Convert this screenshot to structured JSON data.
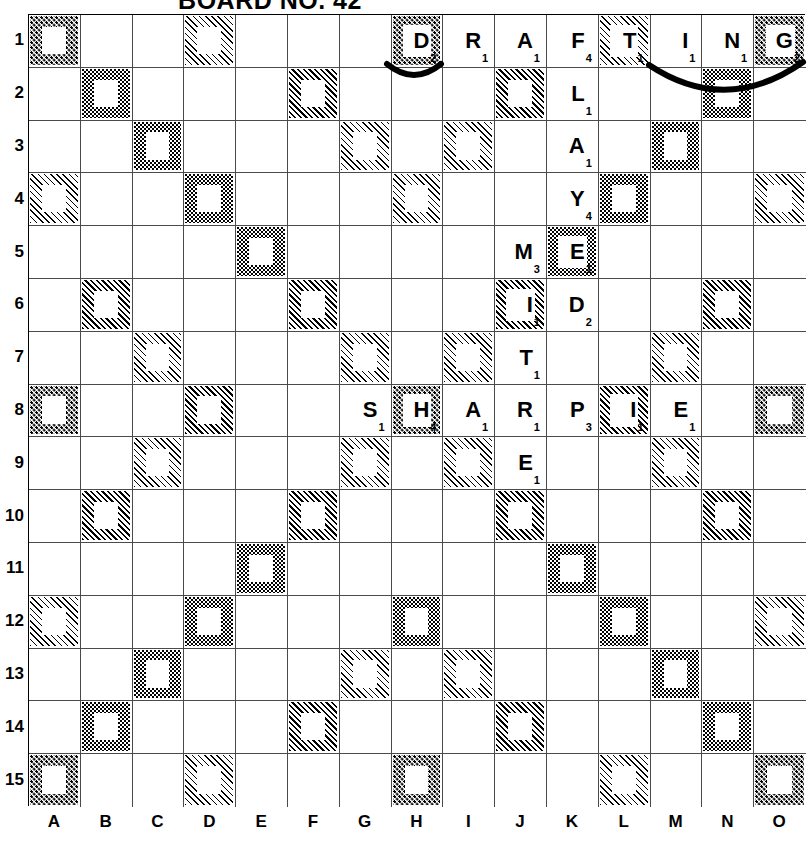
{
  "title": "BOARD NO. 42",
  "board": {
    "columns": [
      "A",
      "B",
      "C",
      "D",
      "E",
      "F",
      "G",
      "H",
      "I",
      "J",
      "K",
      "L",
      "M",
      "N",
      "O"
    ],
    "rows": [
      "1",
      "2",
      "3",
      "4",
      "5",
      "6",
      "7",
      "8",
      "9",
      "10",
      "11",
      "12",
      "13",
      "14",
      "15"
    ],
    "legend": {
      "coarse-dots": "triple-word",
      "fine-dots": "double-word",
      "dark-diagonal-hatch": "triple-letter",
      "light-diagonal-hatch": "double-letter"
    },
    "premium_squares": [
      {
        "col": "A",
        "row": 1,
        "pattern": "coarse"
      },
      {
        "col": "D",
        "row": 1,
        "pattern": "diaglight"
      },
      {
        "col": "H",
        "row": 1,
        "pattern": "coarse"
      },
      {
        "col": "L",
        "row": 1,
        "pattern": "diaglight"
      },
      {
        "col": "O",
        "row": 1,
        "pattern": "coarse"
      },
      {
        "col": "B",
        "row": 2,
        "pattern": "fine"
      },
      {
        "col": "F",
        "row": 2,
        "pattern": "diagdark"
      },
      {
        "col": "J",
        "row": 2,
        "pattern": "diagdark"
      },
      {
        "col": "N",
        "row": 2,
        "pattern": "fine"
      },
      {
        "col": "C",
        "row": 3,
        "pattern": "fine"
      },
      {
        "col": "G",
        "row": 3,
        "pattern": "diaglight"
      },
      {
        "col": "I",
        "row": 3,
        "pattern": "diaglight"
      },
      {
        "col": "M",
        "row": 3,
        "pattern": "fine"
      },
      {
        "col": "A",
        "row": 4,
        "pattern": "diaglight"
      },
      {
        "col": "D",
        "row": 4,
        "pattern": "fine"
      },
      {
        "col": "H",
        "row": 4,
        "pattern": "diaglight"
      },
      {
        "col": "L",
        "row": 4,
        "pattern": "fine"
      },
      {
        "col": "O",
        "row": 4,
        "pattern": "diaglight"
      },
      {
        "col": "E",
        "row": 5,
        "pattern": "fine"
      },
      {
        "col": "K",
        "row": 5,
        "pattern": "fine"
      },
      {
        "col": "B",
        "row": 6,
        "pattern": "diagdark"
      },
      {
        "col": "F",
        "row": 6,
        "pattern": "diagdark"
      },
      {
        "col": "J",
        "row": 6,
        "pattern": "diagdark"
      },
      {
        "col": "N",
        "row": 6,
        "pattern": "diagdark"
      },
      {
        "col": "C",
        "row": 7,
        "pattern": "diaglight"
      },
      {
        "col": "G",
        "row": 7,
        "pattern": "diaglight"
      },
      {
        "col": "I",
        "row": 7,
        "pattern": "diaglight"
      },
      {
        "col": "M",
        "row": 7,
        "pattern": "diaglight"
      },
      {
        "col": "A",
        "row": 8,
        "pattern": "coarse"
      },
      {
        "col": "D",
        "row": 8,
        "pattern": "diagdark"
      },
      {
        "col": "H",
        "row": 8,
        "pattern": "coarse"
      },
      {
        "col": "L",
        "row": 8,
        "pattern": "diagdark"
      },
      {
        "col": "O",
        "row": 8,
        "pattern": "coarse"
      },
      {
        "col": "C",
        "row": 9,
        "pattern": "diaglight"
      },
      {
        "col": "G",
        "row": 9,
        "pattern": "diaglight"
      },
      {
        "col": "I",
        "row": 9,
        "pattern": "diaglight"
      },
      {
        "col": "M",
        "row": 9,
        "pattern": "diaglight"
      },
      {
        "col": "B",
        "row": 10,
        "pattern": "diagdark"
      },
      {
        "col": "F",
        "row": 10,
        "pattern": "diagdark"
      },
      {
        "col": "J",
        "row": 10,
        "pattern": "diagdark"
      },
      {
        "col": "N",
        "row": 10,
        "pattern": "diagdark"
      },
      {
        "col": "E",
        "row": 11,
        "pattern": "fine"
      },
      {
        "col": "K",
        "row": 11,
        "pattern": "fine"
      },
      {
        "col": "A",
        "row": 12,
        "pattern": "diaglight"
      },
      {
        "col": "D",
        "row": 12,
        "pattern": "fine"
      },
      {
        "col": "H",
        "row": 12,
        "pattern": "fine"
      },
      {
        "col": "L",
        "row": 12,
        "pattern": "fine"
      },
      {
        "col": "O",
        "row": 12,
        "pattern": "diaglight"
      },
      {
        "col": "C",
        "row": 13,
        "pattern": "fine"
      },
      {
        "col": "G",
        "row": 13,
        "pattern": "diaglight"
      },
      {
        "col": "I",
        "row": 13,
        "pattern": "diaglight"
      },
      {
        "col": "M",
        "row": 13,
        "pattern": "fine"
      },
      {
        "col": "B",
        "row": 14,
        "pattern": "fine"
      },
      {
        "col": "F",
        "row": 14,
        "pattern": "diagdark"
      },
      {
        "col": "J",
        "row": 14,
        "pattern": "diagdark"
      },
      {
        "col": "N",
        "row": 14,
        "pattern": "fine"
      },
      {
        "col": "A",
        "row": 15,
        "pattern": "coarse"
      },
      {
        "col": "D",
        "row": 15,
        "pattern": "diaglight"
      },
      {
        "col": "H",
        "row": 15,
        "pattern": "coarse"
      },
      {
        "col": "L",
        "row": 15,
        "pattern": "diaglight"
      },
      {
        "col": "O",
        "row": 15,
        "pattern": "coarse"
      }
    ],
    "tiles": [
      {
        "col": "H",
        "row": 1,
        "letter": "D",
        "value": "2"
      },
      {
        "col": "I",
        "row": 1,
        "letter": "R",
        "value": "1"
      },
      {
        "col": "J",
        "row": 1,
        "letter": "A",
        "value": "1"
      },
      {
        "col": "K",
        "row": 1,
        "letter": "F",
        "value": "4"
      },
      {
        "col": "L",
        "row": 1,
        "letter": "T",
        "value": "1"
      },
      {
        "col": "M",
        "row": 1,
        "letter": "I",
        "value": "1"
      },
      {
        "col": "N",
        "row": 1,
        "letter": "N",
        "value": "1"
      },
      {
        "col": "O",
        "row": 1,
        "letter": "G",
        "value": "2"
      },
      {
        "col": "K",
        "row": 2,
        "letter": "L",
        "value": "1"
      },
      {
        "col": "K",
        "row": 3,
        "letter": "A",
        "value": "1"
      },
      {
        "col": "K",
        "row": 4,
        "letter": "Y",
        "value": "4"
      },
      {
        "col": "J",
        "row": 5,
        "letter": "M",
        "value": "3"
      },
      {
        "col": "K",
        "row": 5,
        "letter": "E",
        "value": "1"
      },
      {
        "col": "J",
        "row": 6,
        "letter": "I",
        "value": "1"
      },
      {
        "col": "K",
        "row": 6,
        "letter": "D",
        "value": "2"
      },
      {
        "col": "J",
        "row": 7,
        "letter": "T",
        "value": "1"
      },
      {
        "col": "G",
        "row": 8,
        "letter": "S",
        "value": "1"
      },
      {
        "col": "H",
        "row": 8,
        "letter": "H",
        "value": "4"
      },
      {
        "col": "I",
        "row": 8,
        "letter": "A",
        "value": "1"
      },
      {
        "col": "J",
        "row": 8,
        "letter": "R",
        "value": "1"
      },
      {
        "col": "K",
        "row": 8,
        "letter": "P",
        "value": "3"
      },
      {
        "col": "L",
        "row": 8,
        "letter": "I",
        "value": "1"
      },
      {
        "col": "M",
        "row": 8,
        "letter": "E",
        "value": "1"
      },
      {
        "col": "J",
        "row": 9,
        "letter": "E",
        "value": "1"
      }
    ],
    "annotations": [
      {
        "name": "arc-under-h1",
        "from": "H1",
        "to": "H1"
      },
      {
        "name": "arc-under-i1-o1",
        "from": "I1",
        "to": "O1"
      }
    ]
  }
}
